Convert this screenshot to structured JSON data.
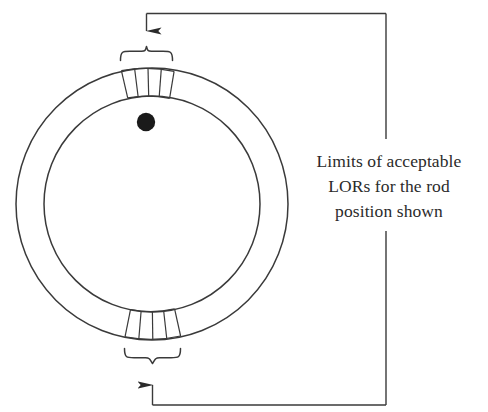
{
  "figure": {
    "kind": "pet-scanner-ring-diagram",
    "background_color": "#ffffff",
    "stroke_color": "#3a3a3a",
    "detector_fill": "#ffffff",
    "rod_color": "#1a1a1a",
    "text_color": "#2b2b2b"
  },
  "annotation": {
    "lines": [
      "Limits of acceptable",
      "LORs for the rod",
      "position shown"
    ],
    "line_1": "Limits of acceptable",
    "line_2": "LORs for the rod",
    "line_3": "position shown"
  },
  "ring": {
    "label": "detector-ring",
    "center_x": 152,
    "center_y": 204,
    "outer_radius": 136,
    "inner_radius": 108
  },
  "rod": {
    "label": "point-source-rod",
    "center_x": 146,
    "center_y": 122,
    "radius": 9
  },
  "segments": {
    "top": {
      "label": "top-detector-block-group",
      "sector_count": 4
    },
    "bottom": {
      "label": "bottom-detector-block-group",
      "sector_count": 4
    }
  },
  "connectors": {
    "top": {
      "label": "top-callout-arrow",
      "direction": "down"
    },
    "bottom": {
      "label": "bottom-callout-arrow",
      "direction": "up"
    }
  }
}
